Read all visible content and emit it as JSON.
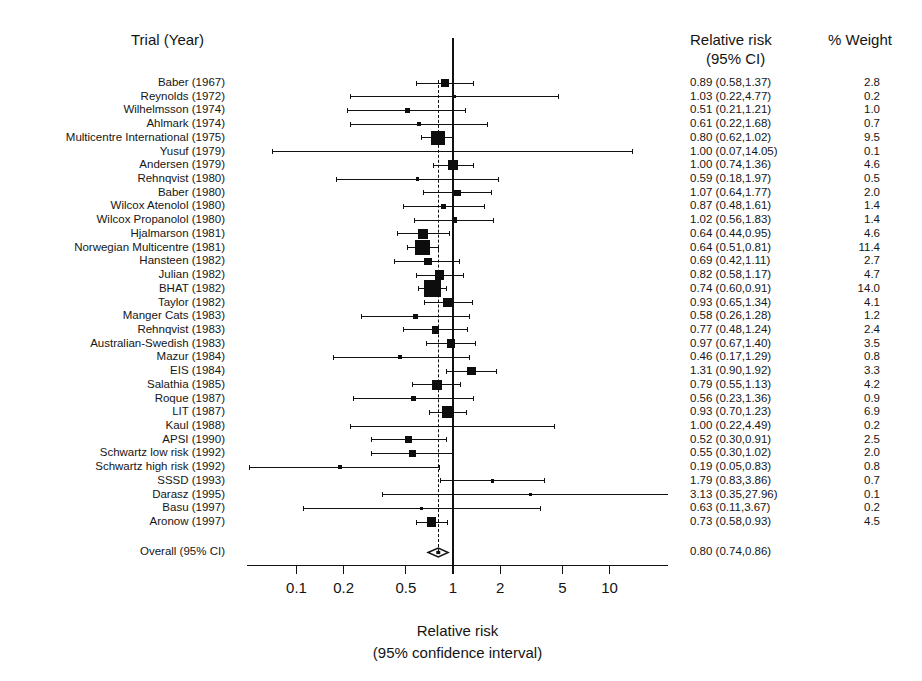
{
  "headers": {
    "trial": "Trial (Year)",
    "rr_line1": "Relative risk",
    "rr_line2": "(95% CI)",
    "weight": "% Weight"
  },
  "axis": {
    "title_line1": "Relative risk",
    "title_line2": "(95% confidence interval)",
    "ticks": [
      "0.1",
      "0.2",
      "0.5",
      "1",
      "2",
      "5",
      "10"
    ],
    "tick_values": [
      0.1,
      0.2,
      0.5,
      1,
      2,
      5,
      10
    ],
    "scale": "log",
    "xmin": 0.09,
    "xmax": 11.5
  },
  "overall": {
    "label": "Overall (95% CI)",
    "rr_text": "0.80 (0.74,0.86)",
    "estimate": 0.8,
    "lower": 0.74,
    "upper": 0.86
  },
  "chart_data": {
    "type": "forest",
    "title": "",
    "xlabel": "Relative risk (95% confidence interval)",
    "ylabel": "",
    "xscale": "log",
    "xlim": [
      0.09,
      11.5
    ],
    "null_value": 1,
    "pooled_value": 0.8,
    "columns": [
      "Trial (Year)",
      "Relative risk (95% CI)",
      "% Weight"
    ],
    "rows": [
      {
        "trial": "Baber (1967)",
        "rr": 0.89,
        "lower": 0.58,
        "upper": 1.37,
        "rr_text": "0.89 (0.58,1.37)",
        "weight": 2.8,
        "weight_text": "2.8"
      },
      {
        "trial": "Reynolds (1972)",
        "rr": 1.03,
        "lower": 0.22,
        "upper": 4.77,
        "rr_text": "1.03 (0.22,4.77)",
        "weight": 0.2,
        "weight_text": "0.2"
      },
      {
        "trial": "Wilhelmsson (1974)",
        "rr": 0.51,
        "lower": 0.21,
        "upper": 1.21,
        "rr_text": "0.51 (0.21,1.21)",
        "weight": 1.0,
        "weight_text": "1.0"
      },
      {
        "trial": "Ahlmark (1974)",
        "rr": 0.61,
        "lower": 0.22,
        "upper": 1.68,
        "rr_text": "0.61 (0.22,1.68)",
        "weight": 0.7,
        "weight_text": "0.7"
      },
      {
        "trial": "Multicentre International (1975)",
        "rr": 0.8,
        "lower": 0.62,
        "upper": 1.02,
        "rr_text": "0.80 (0.62,1.02)",
        "weight": 9.5,
        "weight_text": "9.5"
      },
      {
        "trial": "Yusuf (1979)",
        "rr": 1.0,
        "lower": 0.07,
        "upper": 14.05,
        "rr_text": "1.00 (0.07,14.05)",
        "weight": 0.1,
        "weight_text": "0.1"
      },
      {
        "trial": "Andersen (1979)",
        "rr": 1.0,
        "lower": 0.74,
        "upper": 1.36,
        "rr_text": "1.00 (0.74,1.36)",
        "weight": 4.6,
        "weight_text": "4.6"
      },
      {
        "trial": "Rehnqvist (1980)",
        "rr": 0.59,
        "lower": 0.18,
        "upper": 1.97,
        "rr_text": "0.59 (0.18,1.97)",
        "weight": 0.5,
        "weight_text": "0.5"
      },
      {
        "trial": "Baber (1980)",
        "rr": 1.07,
        "lower": 0.64,
        "upper": 1.77,
        "rr_text": "1.07 (0.64,1.77)",
        "weight": 2.0,
        "weight_text": "2.0"
      },
      {
        "trial": "Wilcox Atenolol (1980)",
        "rr": 0.87,
        "lower": 0.48,
        "upper": 1.61,
        "rr_text": "0.87 (0.48,1.61)",
        "weight": 1.4,
        "weight_text": "1.4"
      },
      {
        "trial": "Wilcox Propanolol (1980)",
        "rr": 1.02,
        "lower": 0.56,
        "upper": 1.83,
        "rr_text": "1.02 (0.56,1.83)",
        "weight": 1.4,
        "weight_text": "1.4"
      },
      {
        "trial": "Hjalmarson (1981)",
        "rr": 0.64,
        "lower": 0.44,
        "upper": 0.95,
        "rr_text": "0.64 (0.44,0.95)",
        "weight": 4.6,
        "weight_text": "4.6"
      },
      {
        "trial": "Norwegian Multicentre (1981)",
        "rr": 0.64,
        "lower": 0.51,
        "upper": 0.81,
        "rr_text": "0.64 (0.51,0.81)",
        "weight": 11.4,
        "weight_text": "11.4"
      },
      {
        "trial": "Hansteen (1982)",
        "rr": 0.69,
        "lower": 0.42,
        "upper": 1.11,
        "rr_text": "0.69 (0.42,1.11)",
        "weight": 2.7,
        "weight_text": "2.7"
      },
      {
        "trial": "Julian (1982)",
        "rr": 0.82,
        "lower": 0.58,
        "upper": 1.17,
        "rr_text": "0.82 (0.58,1.17)",
        "weight": 4.7,
        "weight_text": "4.7"
      },
      {
        "trial": "BHAT (1982)",
        "rr": 0.74,
        "lower": 0.6,
        "upper": 0.91,
        "rr_text": "0.74 (0.60,0.91)",
        "weight": 14.0,
        "weight_text": "14.0"
      },
      {
        "trial": "Taylor (1982)",
        "rr": 0.93,
        "lower": 0.65,
        "upper": 1.34,
        "rr_text": "0.93 (0.65,1.34)",
        "weight": 4.1,
        "weight_text": "4.1"
      },
      {
        "trial": "Manger Cats (1983)",
        "rr": 0.58,
        "lower": 0.26,
        "upper": 1.28,
        "rr_text": "0.58 (0.26,1.28)",
        "weight": 1.2,
        "weight_text": "1.2"
      },
      {
        "trial": "Rehnqvist (1983)",
        "rr": 0.77,
        "lower": 0.48,
        "upper": 1.24,
        "rr_text": "0.77 (0.48,1.24)",
        "weight": 2.4,
        "weight_text": "2.4"
      },
      {
        "trial": "Australian-Swedish (1983)",
        "rr": 0.97,
        "lower": 0.67,
        "upper": 1.4,
        "rr_text": "0.97 (0.67,1.40)",
        "weight": 3.5,
        "weight_text": "3.5"
      },
      {
        "trial": "Mazur (1984)",
        "rr": 0.46,
        "lower": 0.17,
        "upper": 1.29,
        "rr_text": "0.46 (0.17,1.29)",
        "weight": 0.8,
        "weight_text": "0.8"
      },
      {
        "trial": "EIS (1984)",
        "rr": 1.31,
        "lower": 0.9,
        "upper": 1.92,
        "rr_text": "1.31 (0.90,1.92)",
        "weight": 3.3,
        "weight_text": "3.3"
      },
      {
        "trial": "Salathia (1985)",
        "rr": 0.79,
        "lower": 0.55,
        "upper": 1.13,
        "rr_text": "0.79 (0.55,1.13)",
        "weight": 4.2,
        "weight_text": "4.2"
      },
      {
        "trial": "Roque (1987)",
        "rr": 0.56,
        "lower": 0.23,
        "upper": 1.36,
        "rr_text": "0.56 (0.23,1.36)",
        "weight": 0.9,
        "weight_text": "0.9"
      },
      {
        "trial": "LIT (1987)",
        "rr": 0.93,
        "lower": 0.7,
        "upper": 1.23,
        "rr_text": "0.93 (0.70,1.23)",
        "weight": 6.9,
        "weight_text": "6.9"
      },
      {
        "trial": "Kaul (1988)",
        "rr": 1.0,
        "lower": 0.22,
        "upper": 4.49,
        "rr_text": "1.00 (0.22,4.49)",
        "weight": 0.2,
        "weight_text": "0.2"
      },
      {
        "trial": "APSI (1990)",
        "rr": 0.52,
        "lower": 0.3,
        "upper": 0.91,
        "rr_text": "0.52 (0.30,0.91)",
        "weight": 2.5,
        "weight_text": "2.5"
      },
      {
        "trial": "Schwartz low risk (1992)",
        "rr": 0.55,
        "lower": 0.3,
        "upper": 1.02,
        "rr_text": "0.55 (0.30,1.02)",
        "weight": 2.0,
        "weight_text": "2.0"
      },
      {
        "trial": "Schwartz high risk (1992)",
        "rr": 0.19,
        "lower": 0.05,
        "upper": 0.83,
        "rr_text": "0.19 (0.05,0.83)",
        "weight": 0.8,
        "weight_text": "0.8"
      },
      {
        "trial": "SSSD (1993)",
        "rr": 1.79,
        "lower": 0.83,
        "upper": 3.86,
        "rr_text": "1.79 (0.83,3.86)",
        "weight": 0.7,
        "weight_text": "0.7"
      },
      {
        "trial": "Darasz (1995)",
        "rr": 3.13,
        "lower": 0.35,
        "upper": 27.96,
        "rr_text": "3.13 (0.35,27.96)",
        "weight": 0.1,
        "weight_text": "0.1"
      },
      {
        "trial": "Basu (1997)",
        "rr": 0.63,
        "lower": 0.11,
        "upper": 3.67,
        "rr_text": "0.63 (0.11,3.67)",
        "weight": 0.2,
        "weight_text": "0.2"
      },
      {
        "trial": "Aronow (1997)",
        "rr": 0.73,
        "lower": 0.58,
        "upper": 0.93,
        "rr_text": "0.73 (0.58,0.93)",
        "weight": 4.5,
        "weight_text": "4.5"
      }
    ],
    "pooled": {
      "label": "Overall (95% CI)",
      "rr": 0.8,
      "lower": 0.74,
      "upper": 0.86,
      "rr_text": "0.80 (0.74,0.86)"
    }
  },
  "colors": {
    "ink": "#111111",
    "background": "#ffffff"
  }
}
